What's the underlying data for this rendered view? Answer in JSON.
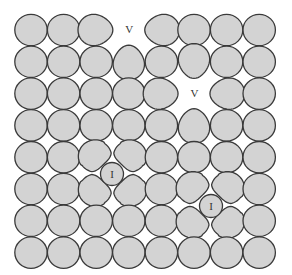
{
  "diagram": {
    "colors": {
      "atom_fill": "#d3d3d3",
      "atom_stroke": "#3a3a3a",
      "background": "#ffffff"
    },
    "grid": {
      "rows": 8,
      "cols": 8,
      "origin_x": 31,
      "origin_y": 30,
      "spacing_x": 32.6,
      "spacing_y": 31.8,
      "radius_x": 16.2,
      "radius_y": 15.7
    },
    "vacancies": [
      {
        "row": 0,
        "col": 3,
        "label": "V"
      },
      {
        "row": 2,
        "col": 5,
        "label": "V"
      }
    ],
    "deformed_atoms": [
      {
        "row": 0,
        "col": 2,
        "point": "right"
      },
      {
        "row": 0,
        "col": 4,
        "point": "left"
      },
      {
        "row": 1,
        "col": 3,
        "point": "up"
      },
      {
        "row": 1,
        "col": 5,
        "point": "down"
      },
      {
        "row": 2,
        "col": 4,
        "point": "right"
      },
      {
        "row": 2,
        "col": 6,
        "point": "left"
      },
      {
        "row": 3,
        "col": 5,
        "point": "up"
      },
      {
        "row": 4,
        "col": 2,
        "squash": "down-right"
      },
      {
        "row": 4,
        "col": 3,
        "squash": "down-left"
      },
      {
        "row": 5,
        "col": 2,
        "squash": "up-right"
      },
      {
        "row": 5,
        "col": 3,
        "squash": "up-left"
      },
      {
        "row": 5,
        "col": 5,
        "squash": "down-right"
      },
      {
        "row": 5,
        "col": 6,
        "squash": "down-left"
      },
      {
        "row": 6,
        "col": 5,
        "squash": "up-right"
      },
      {
        "row": 6,
        "col": 6,
        "squash": "up-left"
      }
    ],
    "interstitials": [
      {
        "cx": 112,
        "cy": 174,
        "r": 11.5,
        "label": "I"
      },
      {
        "cx": 211,
        "cy": 206,
        "r": 11.5,
        "label": "I"
      }
    ]
  }
}
